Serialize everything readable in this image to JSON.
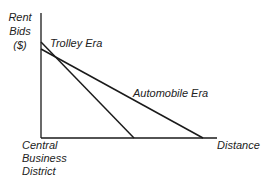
{
  "diagram": {
    "y_axis_label": [
      "Rent",
      "Bids",
      "($)"
    ],
    "x_axis_label": "Distance",
    "origin_label": [
      "Central",
      "Business",
      "District"
    ],
    "lines": [
      {
        "name": "Trolley Era",
        "label": "Trolley Era"
      },
      {
        "name": "Automobile Era",
        "label": "Automobile Era"
      }
    ],
    "colors": {
      "line": "#1a1a1a",
      "background": "#ffffff"
    }
  }
}
